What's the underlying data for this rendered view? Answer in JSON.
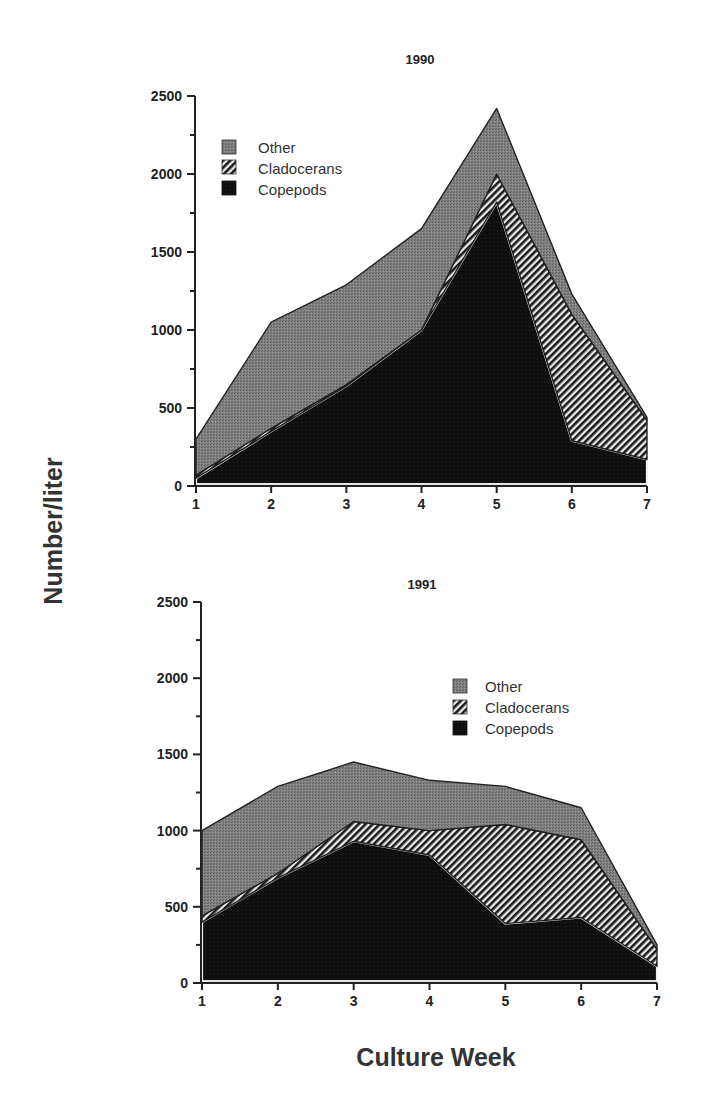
{
  "chart_data": [
    {
      "type": "area",
      "stacked": true,
      "title": "1990",
      "xlabel": "Culture Week",
      "ylabel": "Number/liter",
      "categories": [
        1,
        2,
        3,
        4,
        5,
        6,
        7
      ],
      "ylim": [
        0,
        2500
      ],
      "yticks": [
        0,
        500,
        1000,
        1500,
        2000,
        2500
      ],
      "grid": false,
      "legend_position": "upper left",
      "series": [
        {
          "name": "Copepods",
          "values": [
            50,
            350,
            640,
            1000,
            1820,
            290,
            170
          ]
        },
        {
          "name": "Cladocerans",
          "values": [
            20,
            20,
            10,
            0,
            180,
            810,
            250
          ]
        },
        {
          "name": "Other",
          "values": [
            230,
            680,
            640,
            650,
            420,
            130,
            20
          ]
        }
      ],
      "totals": [
        300,
        1050,
        1290,
        1650,
        2420,
        1230,
        440
      ]
    },
    {
      "type": "area",
      "stacked": true,
      "title": "1991",
      "xlabel": "Culture Week",
      "ylabel": "Number/liter",
      "categories": [
        1,
        2,
        3,
        4,
        5,
        6,
        7
      ],
      "ylim": [
        0,
        2500
      ],
      "yticks": [
        0,
        500,
        1000,
        1500,
        2000,
        2500
      ],
      "grid": false,
      "legend_position": "center right",
      "series": [
        {
          "name": "Copepods",
          "values": [
            400,
            690,
            930,
            840,
            390,
            430,
            110
          ]
        },
        {
          "name": "Cladocerans",
          "values": [
            40,
            30,
            130,
            160,
            650,
            510,
            110
          ]
        },
        {
          "name": "Other",
          "values": [
            560,
            570,
            390,
            330,
            250,
            210,
            30
          ]
        }
      ],
      "totals": [
        1000,
        1290,
        1450,
        1330,
        1290,
        1150,
        250
      ]
    }
  ],
  "figure": {
    "ylabel": "Number/liter",
    "xlabel": "Culture Week",
    "charts": [
      {
        "title": "1990"
      },
      {
        "title": "1991"
      }
    ],
    "legend": [
      "Other",
      "Cladocerans",
      "Copepods"
    ],
    "colors": {
      "Other": "#7a7a7a",
      "Cladocerans": "#3a3a3a",
      "Copepods": "#0d0d0d"
    }
  }
}
